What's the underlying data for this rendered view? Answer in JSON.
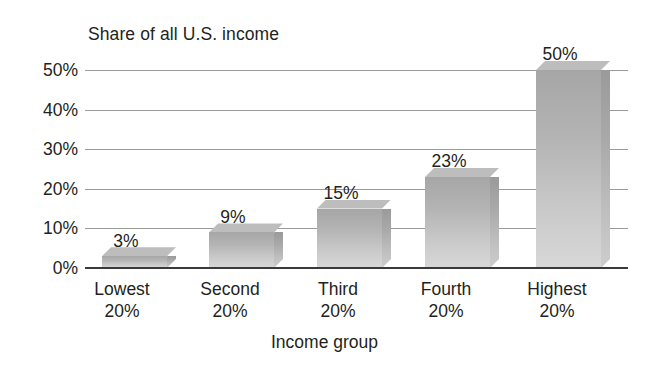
{
  "chart_data": {
    "type": "bar",
    "title": "Share of all U.S. income",
    "xlabel": "Income group",
    "ylabel": "",
    "categories": [
      "Lowest\n20%",
      "Second\n20%",
      "Third\n20%",
      "Fourth\n20%",
      "Highest\n20%"
    ],
    "category_lines": [
      [
        "Lowest",
        "20%"
      ],
      [
        "Second",
        "20%"
      ],
      [
        "Third",
        "20%"
      ],
      [
        "Fourth",
        "20%"
      ],
      [
        "Highest",
        "20%"
      ]
    ],
    "values": [
      3,
      9,
      15,
      23,
      50
    ],
    "value_labels": [
      "3%",
      "9%",
      "15%",
      "23%",
      "50%"
    ],
    "ylim": [
      0,
      50
    ],
    "ytick_values": [
      0,
      10,
      20,
      30,
      40,
      50
    ],
    "ytick_labels": [
      "0%",
      "10%",
      "20%",
      "30%",
      "40%",
      "50%"
    ],
    "grid": true,
    "legend": false,
    "bar_style": "3d-extruded",
    "colors": {
      "bar_face_top": "#a6a6a6",
      "bar_face_bottom": "#d8d8d8",
      "bar_side": "#a9a9a9",
      "bar_top": "#bdbdbd",
      "gridline": "#9b9b9b",
      "axis": "#3a3a3a",
      "text": "#231f20",
      "background": "#ffffff"
    }
  }
}
